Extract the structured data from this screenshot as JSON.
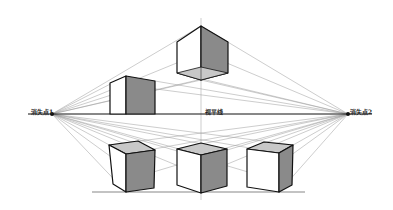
{
  "diagram": {
    "type": "two-point-perspective",
    "labels": {
      "vanishing_point_1": "消失点1",
      "vanishing_point_2": "消失点2",
      "horizon_line": "视平线"
    },
    "colors": {
      "stroke": "#111111",
      "guide": "#9a9a9a",
      "shade_dark": "#8a8a8a",
      "shade_light": "#c8c8c8",
      "face_white": "#ffffff"
    },
    "horizon": {
      "y": 114,
      "x_start": 28,
      "x_end": 372
    },
    "vanishing_points": [
      {
        "x": 52,
        "y": 114
      },
      {
        "x": 348,
        "y": 114
      }
    ],
    "ground_line": {
      "y": 192,
      "x_start": 92,
      "x_end": 305
    },
    "cubes": [
      {
        "name": "top-cube-above-horizon",
        "position": "above"
      },
      {
        "name": "left-box-on-horizon",
        "position": "on-horizon"
      },
      {
        "name": "bottom-left-cube",
        "position": "below"
      },
      {
        "name": "bottom-center-cube",
        "position": "below"
      },
      {
        "name": "bottom-right-cube",
        "position": "below"
      }
    ]
  }
}
